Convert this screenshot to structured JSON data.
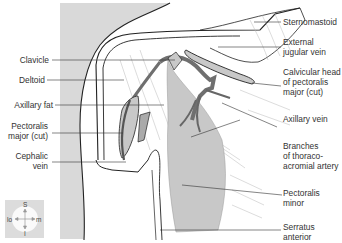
{
  "figure": {
    "colors": {
      "background_panel": "#d9d9d9",
      "muscle_fill": "#c8c8c8",
      "vein_fill": "#7a7a7a",
      "outline": "#222222",
      "label_text": "#333333",
      "leader_line": "#333333"
    }
  },
  "labels": {
    "left": [
      {
        "id": "clavicle",
        "text": "Clavicle"
      },
      {
        "id": "deltoid",
        "text": "Deltoid"
      },
      {
        "id": "axillary_fat",
        "text": "Axillary fat"
      },
      {
        "id": "pectoralis_major_cut_l1",
        "text": "Pectoralis"
      },
      {
        "id": "pectoralis_major_cut_l2",
        "text": "major (cut)"
      },
      {
        "id": "cephalic_vein_l1",
        "text": "Cephalic"
      },
      {
        "id": "cephalic_vein_l2",
        "text": "vein"
      }
    ],
    "right": [
      {
        "id": "sternomastoid",
        "text": "Sternomastoid"
      },
      {
        "id": "external_jugular_l1",
        "text": "External"
      },
      {
        "id": "external_jugular_l2",
        "text": "jugular vein"
      },
      {
        "id": "clavicular_head_l1",
        "text": "Calvicular head"
      },
      {
        "id": "clavicular_head_l2",
        "text": "of pectoralis"
      },
      {
        "id": "clavicular_head_l3",
        "text": "major (cut)"
      },
      {
        "id": "axillary_vein",
        "text": "Axillary vein"
      },
      {
        "id": "branches_l1",
        "text": "Branches"
      },
      {
        "id": "branches_l2",
        "text": "of thoraco-"
      },
      {
        "id": "branches_l3",
        "text": "acromial artery"
      },
      {
        "id": "pectoralis_minor_l1",
        "text": "Pectoralis"
      },
      {
        "id": "pectoralis_minor_l2",
        "text": "minor"
      },
      {
        "id": "serratus_l1",
        "text": "Serratus"
      },
      {
        "id": "serratus_l2",
        "text": "anterior"
      }
    ]
  },
  "compass": {
    "superior": "S",
    "inferior": "I",
    "lateral": "lo",
    "medial": "m"
  }
}
